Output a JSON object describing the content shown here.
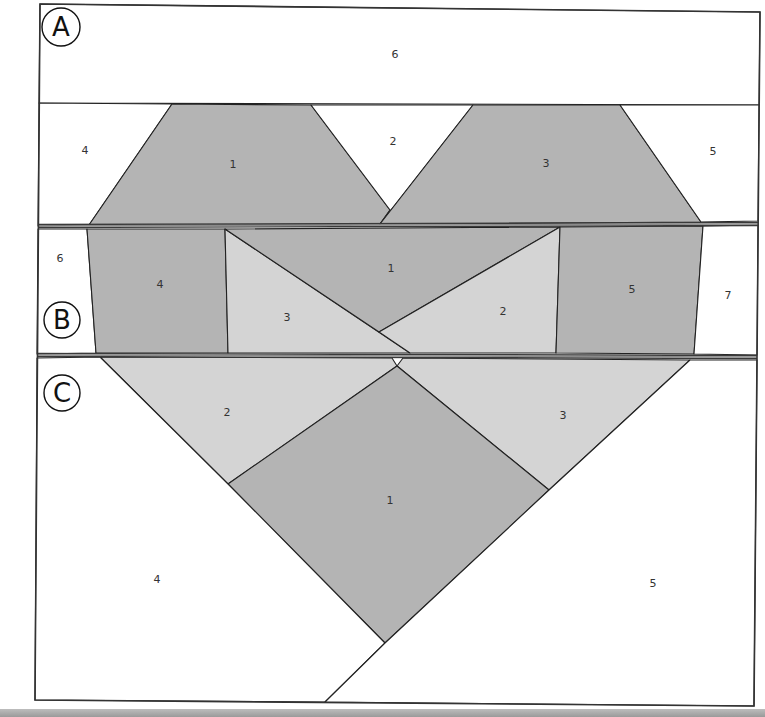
{
  "diagram": {
    "colors": {
      "background": "#ffffff",
      "dark_fabric": "#b4b4b4",
      "light_fabric": "#d4d4d4",
      "outline": "#222222",
      "band_divider": "#3a3a3a"
    },
    "outer_border": [
      [
        40,
        4
      ],
      [
        760,
        12
      ],
      [
        754,
        706
      ],
      [
        35,
        700
      ]
    ],
    "sections": [
      {
        "id": "A",
        "label": "A",
        "badge": {
          "cx": 61,
          "cy": 27,
          "r": 19
        },
        "pieces": [
          {
            "num": "6",
            "fill": "white",
            "points": [
              [
                40,
                4
              ],
              [
                760,
                12
              ],
              [
                759,
                105
              ],
              [
                39,
                103
              ]
            ],
            "label_xy": [
              395,
              54
            ]
          },
          {
            "num": "4",
            "fill": "white",
            "points": [
              [
                39,
                103
              ],
              [
                172,
                104
              ],
              [
                89,
                225
              ],
              [
                38,
                226
              ]
            ],
            "label_xy": [
              85,
              150
            ]
          },
          {
            "num": "1",
            "fill": "dark",
            "points": [
              [
                172,
                104
              ],
              [
                311,
                105
              ],
              [
                390,
                210
              ],
              [
                380,
                224
              ],
              [
                89,
                225
              ]
            ],
            "label_xy": [
              233,
              164
            ]
          },
          {
            "num": "2",
            "fill": "white",
            "points": [
              [
                311,
                105
              ],
              [
                473,
                105
              ],
              [
                380,
                224
              ],
              [
                390,
                210
              ]
            ],
            "label_xy": [
              393,
              141
            ]
          },
          {
            "num": "3",
            "fill": "dark",
            "points": [
              [
                473,
                105
              ],
              [
                620,
                105
              ],
              [
                701,
                222
              ],
              [
                380,
                224
              ]
            ],
            "label_xy": [
              546,
              163
            ]
          },
          {
            "num": "5",
            "fill": "white",
            "points": [
              [
                620,
                105
              ],
              [
                759,
                105
              ],
              [
                758,
                221
              ],
              [
                701,
                222
              ]
            ],
            "label_xy": [
              713,
              151
            ]
          }
        ]
      },
      {
        "id": "B",
        "label": "B",
        "badge": {
          "cx": 62,
          "cy": 320,
          "r": 18
        },
        "pieces": [
          {
            "num": "6",
            "fill": "white",
            "points": [
              [
                38,
                229
              ],
              [
                87,
                229
              ],
              [
                96,
                353
              ],
              [
                37,
                354
              ]
            ],
            "label_xy": [
              60,
              258
            ]
          },
          {
            "num": "4",
            "fill": "dark",
            "points": [
              [
                87,
                229
              ],
              [
                225,
                229
              ],
              [
                228,
                353
              ],
              [
                96,
                353
              ]
            ],
            "label_xy": [
              160,
              284
            ]
          },
          {
            "num": "3",
            "fill": "light",
            "points": [
              [
                225,
                229
              ],
              [
                410,
                353
              ],
              [
                228,
                353
              ]
            ],
            "label_xy": [
              287,
              317
            ]
          },
          {
            "num": "1",
            "fill": "dark",
            "points": [
              [
                225,
                229
              ],
              [
                560,
                227
              ],
              [
                379,
                332
              ]
            ],
            "label_xy": [
              391,
              268
            ]
          },
          {
            "num": "2",
            "fill": "light",
            "points": [
              [
                560,
                227
              ],
              [
                556,
                353
              ],
              [
                410,
                353
              ],
              [
                379,
                332
              ]
            ],
            "label_xy": [
              503,
              311
            ]
          },
          {
            "num": "5",
            "fill": "dark",
            "points": [
              [
                560,
                227
              ],
              [
                703,
                226
              ],
              [
                694,
                354
              ],
              [
                556,
                353
              ]
            ],
            "label_xy": [
              632,
              289
            ]
          },
          {
            "num": "7",
            "fill": "white",
            "points": [
              [
                703,
                226
              ],
              [
                758,
                225
              ],
              [
                757,
                355
              ],
              [
                694,
                354
              ]
            ],
            "label_xy": [
              728,
              295
            ]
          }
        ]
      },
      {
        "id": "C",
        "label": "C",
        "badge": {
          "cx": 62,
          "cy": 393,
          "r": 18
        },
        "pieces": [
          {
            "num": "2",
            "fill": "light",
            "points": [
              [
                100,
                357
              ],
              [
                392,
                358
              ],
              [
                397,
                366
              ],
              [
                228,
                484
              ]
            ],
            "label_xy": [
              227,
              412
            ]
          },
          {
            "num": "3",
            "fill": "light",
            "points": [
              [
                397,
                366
              ],
              [
                403,
                358
              ],
              [
                690,
                360
              ],
              [
                549,
                490
              ]
            ],
            "label_xy": [
              563,
              415
            ]
          },
          {
            "num": "1",
            "fill": "dark",
            "points": [
              [
                397,
                366
              ],
              [
                549,
                490
              ],
              [
                385,
                643
              ],
              [
                228,
                484
              ]
            ],
            "label_xy": [
              390,
              500
            ]
          },
          {
            "num": "4",
            "fill": "white",
            "points": [
              [
                37,
                358
              ],
              [
                100,
                357
              ],
              [
                228,
                484
              ],
              [
                385,
                643
              ],
              [
                325,
                702
              ],
              [
                35,
                700
              ]
            ],
            "label_xy": [
              157,
              579
            ]
          },
          {
            "num": "5",
            "fill": "white",
            "points": [
              [
                690,
                360
              ],
              [
                757,
                360
              ],
              [
                754,
                706
              ],
              [
                325,
                702
              ],
              [
                385,
                643
              ],
              [
                549,
                490
              ]
            ],
            "label_xy": [
              653,
              583
            ]
          }
        ]
      }
    ],
    "band_dividers": [
      {
        "y1": 226,
        "y2": 224,
        "x1": 38,
        "x2": 758
      },
      {
        "y1": 355,
        "y2": 357,
        "x1": 37,
        "x2": 757
      }
    ]
  }
}
